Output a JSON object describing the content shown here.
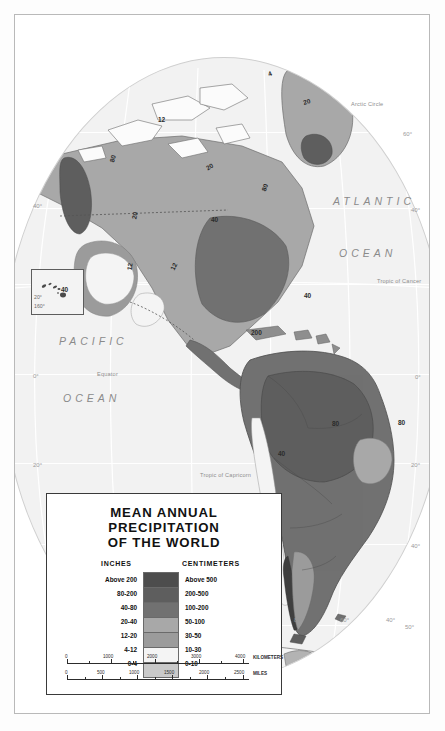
{
  "legend": {
    "title_line1": "MEAN ANNUAL PRECIPITATION",
    "title_line2": "OF THE WORLD",
    "col_inches": "INCHES",
    "col_centimeters": "CENTIMETERS",
    "classes": [
      {
        "inches": "Above 200",
        "centimeters": "Above 500",
        "color": "#4d4d4d"
      },
      {
        "inches": "80-200",
        "centimeters": "200-500",
        "color": "#5e5e5e"
      },
      {
        "inches": "40-80",
        "centimeters": "100-200",
        "color": "#717171"
      },
      {
        "inches": "20-40",
        "centimeters": "50-100",
        "color": "#a8a8a8"
      },
      {
        "inches": "12-20",
        "centimeters": "30-50",
        "color": "#9b9b9b"
      },
      {
        "inches": "4-12",
        "centimeters": "10-30",
        "color": "#f4f4f4"
      },
      {
        "inches": "0-4",
        "centimeters": "0-10",
        "color": "#c9c9c9"
      }
    ],
    "scale": {
      "km_ticks": [
        "0",
        "1000",
        "2000",
        "3000",
        "4000"
      ],
      "km_unit": "KILOMETERS",
      "mi_ticks": [
        "0",
        "500",
        "1000",
        "1500",
        "2000",
        "2500"
      ],
      "mi_unit": "MILES"
    }
  },
  "inset": {
    "lat_label": "20°",
    "lon_label": "160°",
    "contour": "40"
  },
  "map": {
    "oceans": [
      {
        "name": "ATLANTIC",
        "x": 318,
        "y": 180
      },
      {
        "name": "OCEAN",
        "x": 324,
        "y": 232
      },
      {
        "name": "PACIFIC",
        "x": 44,
        "y": 320
      },
      {
        "name": "OCEAN",
        "x": 48,
        "y": 377
      }
    ],
    "reference_lines": [
      {
        "label": "Arctic Circle",
        "x": 336,
        "y": 86
      },
      {
        "label": "Tropic of Cancer",
        "x": 362,
        "y": 263
      },
      {
        "label": "Equator",
        "x": 82,
        "y": 356
      },
      {
        "label": "Tropic of Capricorn",
        "x": 185,
        "y": 457
      }
    ],
    "coordinates": [
      {
        "label": "60°",
        "x": 388,
        "y": 116
      },
      {
        "label": "40°",
        "x": 18,
        "y": 188
      },
      {
        "label": "40°",
        "x": 412,
        "y": 192
      },
      {
        "label": "0°",
        "x": 18,
        "y": 358
      },
      {
        "label": "0°",
        "x": 412,
        "y": 359
      },
      {
        "label": "20°",
        "x": 18,
        "y": 447
      },
      {
        "label": "20°",
        "x": 412,
        "y": 447
      },
      {
        "label": "40°",
        "x": 412,
        "y": 528
      },
      {
        "label": "50°",
        "x": 406,
        "y": 609
      },
      {
        "label": "80°",
        "x": 279,
        "y": 602
      },
      {
        "label": "60°",
        "x": 325,
        "y": 602
      },
      {
        "label": "40°",
        "x": 371,
        "y": 602
      }
    ],
    "contour_labels": [
      {
        "value": "12",
        "x": 143,
        "y": 101
      },
      {
        "value": "20",
        "x": 288,
        "y": 83
      },
      {
        "value": "4",
        "x": 253,
        "y": 55
      },
      {
        "value": "20",
        "x": 191,
        "y": 148
      },
      {
        "value": "80",
        "x": 94,
        "y": 140
      },
      {
        "value": "20",
        "x": 116,
        "y": 197
      },
      {
        "value": "80",
        "x": 246,
        "y": 169
      },
      {
        "value": "40",
        "x": 196,
        "y": 201
      },
      {
        "value": "12",
        "x": 111,
        "y": 248
      },
      {
        "value": "12",
        "x": 155,
        "y": 248
      },
      {
        "value": "40",
        "x": 289,
        "y": 277
      },
      {
        "value": "200",
        "x": 236,
        "y": 314
      },
      {
        "value": "80",
        "x": 317,
        "y": 405
      },
      {
        "value": "80",
        "x": 383,
        "y": 404
      },
      {
        "value": "40",
        "x": 263,
        "y": 435
      }
    ]
  }
}
